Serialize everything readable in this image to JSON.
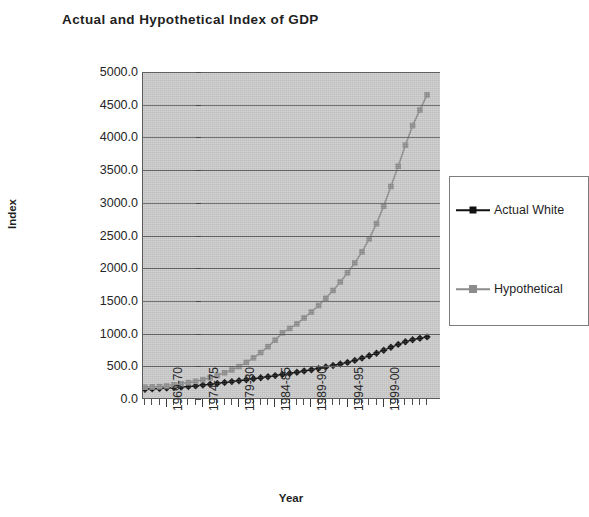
{
  "chart_data": {
    "type": "line",
    "title": "Actual and Hypothetical Index of GDP",
    "xlabel": "Year",
    "ylabel": "Index",
    "ylim": [
      0,
      5000
    ],
    "ytick_labels": [
      "5000.0",
      "4500.0",
      "4000.0",
      "3500.0",
      "3000.0",
      "2500.0",
      "2000.0",
      "1500.0",
      "1000.0",
      "500.0",
      "0.0"
    ],
    "ytick_values": [
      5000,
      4500,
      4000,
      3500,
      3000,
      2500,
      2000,
      1500,
      1000,
      500,
      0
    ],
    "grid": "horizontal",
    "legend_position": "right",
    "x": [
      "1966-67",
      "1967-68",
      "1968-69",
      "1969-70",
      "1970-71",
      "1971-72",
      "1972-73",
      "1973-74",
      "1974-75",
      "1975-76",
      "1976-77",
      "1977-78",
      "1978-79",
      "1979-80",
      "1980-81",
      "1981-82",
      "1982-83",
      "1983-84",
      "1984-85",
      "1985-86",
      "1986-87",
      "1987-88",
      "1988-89",
      "1989-90",
      "1990-91",
      "1991-92",
      "1992-93",
      "1993-94",
      "1994-95",
      "1995-96",
      "1996-97",
      "1997-98",
      "1998-99",
      "1999-00",
      "2000-01",
      "2001-02",
      "2002-03",
      "2003-04",
      "2004-05",
      "2005-06"
    ],
    "xtick_labels": [
      "1969-70",
      "1974-75",
      "1979-80",
      "1984-85",
      "1989-90",
      "1994-95",
      "1999-00"
    ],
    "xtick_indices": [
      3,
      8,
      13,
      18,
      23,
      28,
      33
    ],
    "series": [
      {
        "name": "Actual White",
        "color": "#111111",
        "marker": "diamond",
        "values": [
          150,
          155,
          160,
          168,
          175,
          182,
          190,
          200,
          212,
          225,
          238,
          252,
          266,
          280,
          295,
          310,
          325,
          340,
          358,
          375,
          392,
          410,
          428,
          448,
          468,
          490,
          512,
          535,
          560,
          590,
          625,
          660,
          700,
          745,
          790,
          835,
          875,
          905,
          930,
          950
        ]
      },
      {
        "name": "Hypothetical",
        "color": "#8c8c8c",
        "marker": "square",
        "values": [
          180,
          185,
          190,
          200,
          215,
          232,
          250,
          270,
          295,
          325,
          360,
          400,
          445,
          495,
          560,
          630,
          710,
          800,
          900,
          1010,
          1080,
          1150,
          1240,
          1330,
          1430,
          1540,
          1660,
          1790,
          1930,
          2080,
          2250,
          2450,
          2680,
          2950,
          3250,
          3560,
          3880,
          4180,
          4420,
          4650
        ]
      }
    ]
  },
  "legend": {
    "entries": [
      {
        "label": "Actual White",
        "marker": "diamond-marker",
        "color": "#111111"
      },
      {
        "label": "Hypothetical",
        "marker": "square-marker",
        "color": "#8c8c8c"
      }
    ]
  }
}
